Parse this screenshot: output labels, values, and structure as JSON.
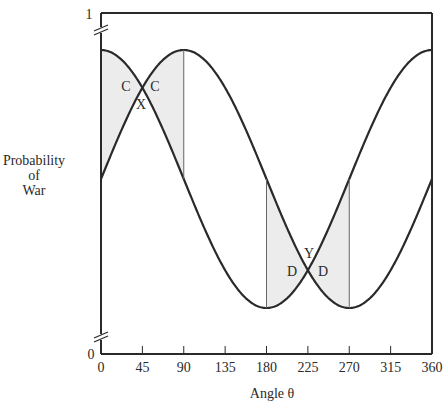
{
  "chart_data": {
    "type": "line",
    "title": "",
    "xlabel": "Angle θ",
    "ylabel": "Probability of War",
    "ylabel_lines": [
      "Probability",
      "of",
      "War"
    ],
    "xlim": [
      0,
      360
    ],
    "ylim": [
      0,
      1
    ],
    "x_ticks": [
      0,
      45,
      90,
      135,
      180,
      225,
      270,
      315,
      360
    ],
    "y_ticks": [
      0,
      1
    ],
    "axis_break": true,
    "grid": false,
    "legend": null,
    "series": [
      {
        "name": "curve-cos",
        "description": "peaks at 0 and 360, minimum at 180",
        "x": [
          0,
          45,
          90,
          135,
          180,
          225,
          270,
          315,
          360
        ],
        "values": [
          0.9,
          0.79,
          0.53,
          0.26,
          0.15,
          0.26,
          0.53,
          0.79,
          0.9
        ]
      },
      {
        "name": "curve-sin",
        "description": "peaks at 90, minimum at 270",
        "x": [
          0,
          45,
          90,
          135,
          180,
          225,
          270,
          315,
          360
        ],
        "values": [
          0.53,
          0.79,
          0.9,
          0.79,
          0.53,
          0.26,
          0.15,
          0.26,
          0.53
        ]
      }
    ],
    "shaded_regions": [
      {
        "x_range": [
          0,
          90
        ],
        "between": [
          "curve-cos",
          "curve-sin"
        ]
      },
      {
        "x_range": [
          180,
          270
        ],
        "between": [
          "curve-cos",
          "curve-sin"
        ]
      }
    ],
    "annotations": [
      {
        "text": "C",
        "x": 30,
        "near": "left of crossing at 45"
      },
      {
        "text": "C",
        "x": 60,
        "near": "right of crossing at 45"
      },
      {
        "text": "X",
        "x": 45,
        "near": "below crossing at 45"
      },
      {
        "text": "D",
        "x": 210,
        "near": "left of crossing at 225"
      },
      {
        "text": "D",
        "x": 240,
        "near": "right of crossing at 225"
      },
      {
        "text": "Y",
        "x": 225,
        "near": "above crossing at 225"
      }
    ]
  },
  "labels": {
    "y_top": "1",
    "y_bottom": "0",
    "xlabel": "Angle θ",
    "ylabel_1": "Probability",
    "ylabel_2": "of",
    "ylabel_3": "War",
    "ann_c": "C",
    "ann_x": "X",
    "ann_d": "D",
    "ann_y": "Y"
  },
  "colors": {
    "line": "#2a2a2a",
    "shade": "#ececec"
  }
}
